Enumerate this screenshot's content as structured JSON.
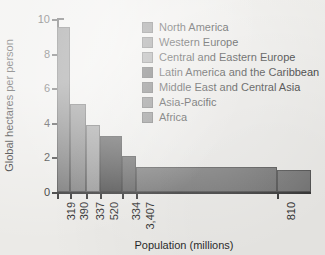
{
  "chart_data": {
    "type": "bar",
    "title": "",
    "subtitle": "",
    "xlabel": "Population (millions)",
    "ylabel": "Global hectares per person",
    "grid": false,
    "legend_position": "top-right-inside",
    "ylim": [
      0,
      10
    ],
    "y_ticks": [
      0,
      2,
      4,
      6,
      8,
      10
    ],
    "y_tick_labels": [
      "0",
      "2",
      "4",
      "6",
      "8",
      "10"
    ],
    "note": "Variable-width bar chart: bar width encodes population (millions), bar height encodes global hectares per person.",
    "x_total_population": 6117,
    "categories": [
      "North America",
      "Western Europe",
      "Central and Eastern Europe",
      "Latin America and the Caribbean",
      "Middle East and Central Asia",
      "Asia-Pacific",
      "Africa"
    ],
    "values": [
      9.55,
      5.1,
      3.85,
      3.25,
      2.1,
      1.45,
      1.3
    ],
    "widths": [
      319,
      390,
      337,
      520,
      334,
      3407,
      810
    ],
    "x_tick_labels": [
      "319",
      "390",
      "337",
      "520",
      "334",
      "3,407",
      "810"
    ],
    "colors": [
      "#6e6e6e",
      "#787878",
      "#8e8e8e",
      "#3f3f3f",
      "#565656",
      "#6b6b6b",
      "#6e6e6e"
    ],
    "series": [
      {
        "name": "Global hectares per person",
        "points": [
          {
            "label": "North America",
            "population": 319,
            "value": 9.55,
            "tick": "319",
            "color": "#6e6e6e"
          },
          {
            "label": "Western Europe",
            "population": 390,
            "value": 5.1,
            "tick": "390",
            "color": "#787878"
          },
          {
            "label": "Central and Eastern Europe",
            "population": 337,
            "value": 3.85,
            "tick": "337",
            "color": "#8e8e8e"
          },
          {
            "label": "Latin America and the Caribbean",
            "population": 520,
            "value": 3.25,
            "tick": "520",
            "color": "#3f3f3f"
          },
          {
            "label": "Middle East and Central Asia",
            "population": 334,
            "value": 2.1,
            "tick": "334",
            "color": "#565656"
          },
          {
            "label": "Asia-Pacific",
            "population": 3407,
            "value": 1.45,
            "tick": "3,407",
            "color": "#6b6b6b"
          },
          {
            "label": "Africa",
            "population": 810,
            "value": 1.3,
            "tick": "810",
            "color": "#6e6e6e"
          }
        ]
      }
    ]
  },
  "legend": {
    "items": [
      {
        "label": "North America",
        "color": "#6e6e6e"
      },
      {
        "label": "Western Europe",
        "color": "#787878"
      },
      {
        "label": "Central and Eastern Europe",
        "color": "#8e8e8e"
      },
      {
        "label": "Latin America and the Caribbean",
        "color": "#3f3f3f"
      },
      {
        "label": "Middle East and Central Asia",
        "color": "#565656"
      },
      {
        "label": "Asia-Pacific",
        "color": "#6b6b6b"
      },
      {
        "label": "Africa",
        "color": "#6e6e6e"
      }
    ]
  }
}
